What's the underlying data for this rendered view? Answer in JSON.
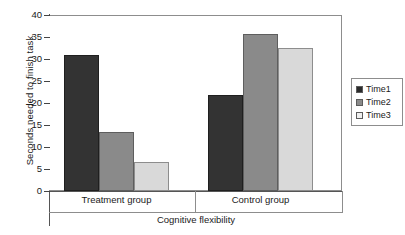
{
  "chart_data": {
    "type": "bar",
    "title": "",
    "xlabel": "Cognitive flexibility",
    "ylabel": "Seconds needed to finish task",
    "categories": [
      "Treatment group",
      "Control group"
    ],
    "series": [
      {
        "name": "Time1",
        "values": [
          31.0,
          21.8
        ],
        "color": "#333333"
      },
      {
        "name": "Time2",
        "values": [
          13.4,
          35.6
        ],
        "color": "#8a8a8a"
      },
      {
        "name": "Time3",
        "values": [
          6.6,
          32.5
        ],
        "color": "#d9d9d9"
      }
    ],
    "ylim": [
      0,
      40
    ],
    "yticks": [
      0,
      5,
      10,
      15,
      20,
      25,
      30,
      35,
      40
    ],
    "ytick_labels": [
      "0",
      "5",
      "10",
      "15",
      "20",
      "25",
      "30",
      "35",
      "40"
    ],
    "grid": false,
    "legend_position": "right"
  }
}
